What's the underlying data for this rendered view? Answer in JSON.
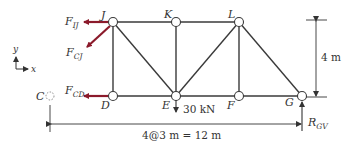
{
  "diagram": {
    "type": "truss-free-body",
    "colors": {
      "member": "#3a3a3a",
      "force_arrow": "#8b1a2b",
      "text": "#333333",
      "node_fill": "#ffffff"
    },
    "nodes": [
      {
        "id": "J",
        "label": "J",
        "x": 113,
        "y": 22
      },
      {
        "id": "K",
        "label": "K",
        "x": 176,
        "y": 22
      },
      {
        "id": "L",
        "label": "L",
        "x": 239,
        "y": 22
      },
      {
        "id": "D",
        "label": "D",
        "x": 113,
        "y": 96
      },
      {
        "id": "E",
        "label": "E",
        "x": 176,
        "y": 96
      },
      {
        "id": "F",
        "label": "F",
        "x": 239,
        "y": 96
      },
      {
        "id": "G",
        "label": "G",
        "x": 302,
        "y": 96
      }
    ],
    "ghost_node": {
      "id": "C",
      "label": "C",
      "x": 50,
      "y": 96
    },
    "members": [
      [
        "J",
        "K"
      ],
      [
        "K",
        "L"
      ],
      [
        "D",
        "E"
      ],
      [
        "E",
        "F"
      ],
      [
        "F",
        "G"
      ],
      [
        "J",
        "D"
      ],
      [
        "K",
        "E"
      ],
      [
        "L",
        "F"
      ],
      [
        "J",
        "E"
      ],
      [
        "E",
        "L"
      ],
      [
        "L",
        "G"
      ]
    ],
    "forces": [
      {
        "name": "F_IJ",
        "main": "F",
        "sub": "IJ",
        "node": "J",
        "direction": "left"
      },
      {
        "name": "F_CJ",
        "main": "F",
        "sub": "CJ",
        "node": "J",
        "direction": "down-left"
      },
      {
        "name": "F_CD",
        "main": "F",
        "sub": "CD",
        "node": "D",
        "direction": "left"
      }
    ],
    "load": {
      "node": "E",
      "value": "30 kN",
      "direction": "down"
    },
    "reaction": {
      "main": "R",
      "sub": "GV",
      "node": "G",
      "direction": "up"
    },
    "dimensions": {
      "height": "4 m",
      "span": "4@3 m = 12 m"
    },
    "axes": {
      "x": "x",
      "y": "y"
    }
  }
}
